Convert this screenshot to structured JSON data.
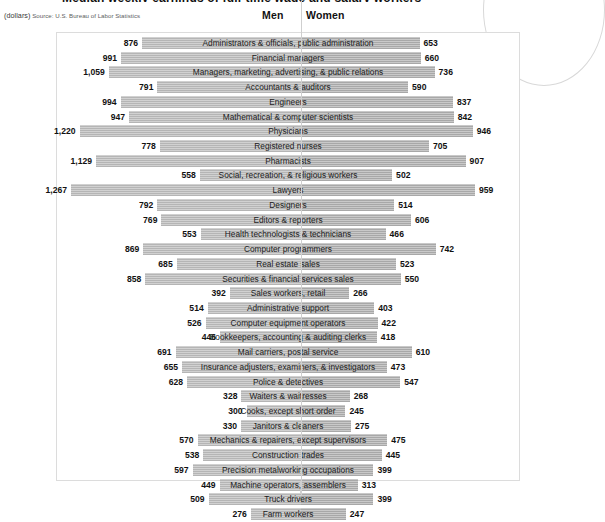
{
  "title_fragment": "Median weekly earnings of full-time wage and salary workers",
  "source_note_units": "(dollars)",
  "source_note_text": "Source: U.S. Bureau of Labor Statistics",
  "headers": {
    "men": "Men",
    "women": "Women"
  },
  "colors": {
    "bar_men": "#b5b5b5",
    "bar_women": "#a8a8a8",
    "frame": "#dcdcdc",
    "divider": "#cfcfcf",
    "text": "#1a1a1a"
  },
  "chart_data": {
    "type": "bar",
    "title": "Median weekly earnings of full-time wage and salary workers",
    "subtitle": "(dollars)",
    "annotation": "Source: U.S. Bureau of Labor Statistics",
    "xlabel": "",
    "ylabel": "",
    "orientation": "horizontal-diverging",
    "grid": false,
    "legend_position": "top-center",
    "axis_max": 1400,
    "categories": [
      "Administrators & officials, public administration",
      "Financial managers",
      "Managers, marketing, advertising, & public relations",
      "Accountants & auditors",
      "Engineers",
      "Mathematical & computer scientists",
      "Physicians",
      "Registered nurses",
      "Pharmacists",
      "Social, recreation, & religious workers",
      "Lawyers",
      "Designers",
      "Editors & reporters",
      "Health technologists & technicians",
      "Computer programmers",
      "Real estate sales",
      "Securities & financial services sales",
      "Sales workers, retail",
      "Administrative support",
      "Computer equipment operators",
      "Bookkeepers, accounting & auditing clerks",
      "Mail carriers, postal service",
      "Insurance adjusters, examiners, & investigators",
      "Police & detectives",
      "Waiters & waitresses",
      "Cooks, except short order",
      "Janitors & cleaners",
      "Mechanics & repairers, except supervisors",
      "Construction trades",
      "Precision metalworking occupations",
      "Machine operators, assemblers",
      "Truck drivers",
      "Farm workers"
    ],
    "series": [
      {
        "name": "Men",
        "values": [
          876,
          991,
          1059,
          791,
          994,
          947,
          1220,
          778,
          1129,
          558,
          1267,
          792,
          769,
          553,
          869,
          685,
          858,
          392,
          514,
          526,
          446,
          691,
          655,
          628,
          328,
          300,
          330,
          570,
          538,
          597,
          449,
          509,
          276
        ],
        "labels": [
          "876",
          "991",
          "1,059",
          "791",
          "994",
          "947",
          "1,220",
          "778",
          "1,129",
          "558",
          "1,267",
          "792",
          "769",
          "553",
          "869",
          "685",
          "858",
          "392",
          "514",
          "526",
          "446",
          "691",
          "655",
          "628",
          "328",
          "300",
          "330",
          "570",
          "538",
          "597",
          "449",
          "509",
          "276"
        ]
      },
      {
        "name": "Women",
        "values": [
          653,
          660,
          736,
          590,
          837,
          842,
          946,
          705,
          907,
          502,
          959,
          514,
          606,
          466,
          742,
          523,
          550,
          266,
          403,
          422,
          418,
          610,
          473,
          547,
          268,
          245,
          275,
          475,
          445,
          399,
          313,
          399,
          247
        ],
        "labels": [
          "653",
          "660",
          "736",
          "590",
          "837",
          "842",
          "946",
          "705",
          "907",
          "502",
          "959",
          "514",
          "606",
          "466",
          "742",
          "523",
          "550",
          "266",
          "403",
          "422",
          "418",
          "610",
          "473",
          "547",
          "268",
          "245",
          "275",
          "475",
          "445",
          "399",
          "313",
          "399",
          "247"
        ]
      }
    ]
  }
}
